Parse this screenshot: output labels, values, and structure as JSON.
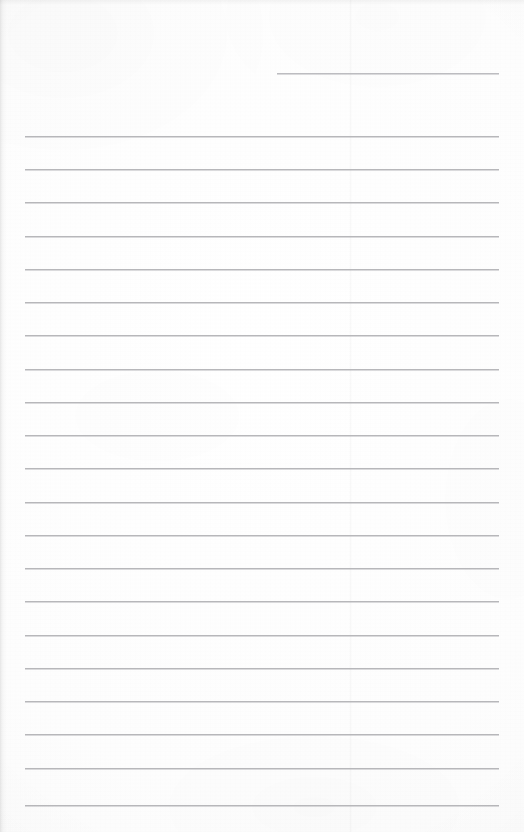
{
  "document": {
    "type": "scanned-lined-paper",
    "title": "Blank ruled notebook page",
    "content_text": "",
    "handwriting_present": "no",
    "page_width": 524,
    "page_height": 832
  },
  "colors": {
    "paper_background": "#fdfdfd",
    "rule_line": "#b7b7ba",
    "rule_line_shadow": "#96969b",
    "fold_line": "#f2f2f3",
    "scan_edge": "#e8e8e9"
  },
  "layout": {
    "rule_left_x": 25,
    "rule_right_x": 499,
    "rule_thickness": 1,
    "rule_spacing": 33.4,
    "first_full_rule_y": 136,
    "last_full_rule_y": 805,
    "fold_line_x": 350
  },
  "header_rule": {
    "label": "header-rule",
    "x": 277,
    "y": 73,
    "width": 222
  },
  "rules": [
    {
      "index": 1,
      "y": 136
    },
    {
      "index": 2,
      "y": 169
    },
    {
      "index": 3,
      "y": 202
    },
    {
      "index": 4,
      "y": 236
    },
    {
      "index": 5,
      "y": 269
    },
    {
      "index": 6,
      "y": 302
    },
    {
      "index": 7,
      "y": 335
    },
    {
      "index": 8,
      "y": 369
    },
    {
      "index": 9,
      "y": 402
    },
    {
      "index": 10,
      "y": 435
    },
    {
      "index": 11,
      "y": 468
    },
    {
      "index": 12,
      "y": 502
    },
    {
      "index": 13,
      "y": 535
    },
    {
      "index": 14,
      "y": 568
    },
    {
      "index": 15,
      "y": 601
    },
    {
      "index": 16,
      "y": 635
    },
    {
      "index": 17,
      "y": 668
    },
    {
      "index": 18,
      "y": 701
    },
    {
      "index": 19,
      "y": 734
    },
    {
      "index": 20,
      "y": 768
    },
    {
      "index": 21,
      "y": 805
    }
  ]
}
